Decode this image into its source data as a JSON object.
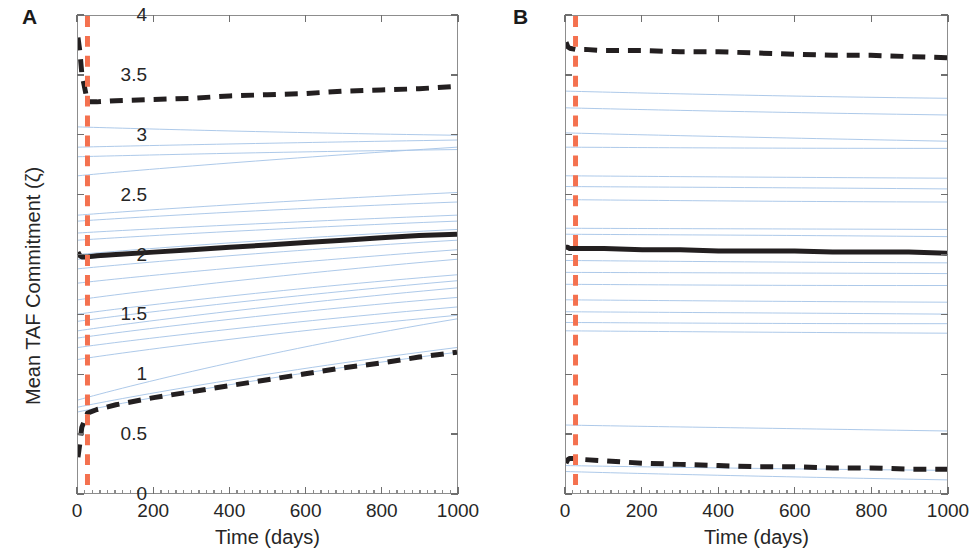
{
  "figure": {
    "panels": [
      {
        "letter": "A",
        "axes": {
          "xlabel": "Time (days)",
          "ylabel": "Mean TAF Commitment (ζ)",
          "xticks": [
            0,
            200,
            400,
            600,
            800,
            1000
          ],
          "xtick_labels": [
            "0",
            "200",
            "400",
            "600",
            "800",
            "1000"
          ],
          "yticks": [
            0,
            0.5,
            1,
            1.5,
            2,
            2.5,
            3,
            3.5,
            4
          ],
          "ytick_labels": [
            "0",
            "0.5",
            "1",
            "1.5",
            "2",
            "2.5",
            "3",
            "3.5",
            "4"
          ],
          "xlim": [
            0,
            1000
          ],
          "ylim": [
            0,
            4
          ]
        }
      },
      {
        "letter": "B",
        "axes": {
          "xlabel": "Time (days)",
          "ylabel": "",
          "xticks": [
            0,
            200,
            400,
            600,
            800,
            1000
          ],
          "xtick_labels": [
            "0",
            "200",
            "400",
            "600",
            "800",
            "1000"
          ],
          "yticks": [
            0,
            0.5,
            1,
            1.5,
            2,
            2.5,
            3,
            3.5,
            4
          ],
          "ytick_labels": [
            "0",
            "0.5",
            "1",
            "1.5",
            "2",
            "2.5",
            "3",
            "3.5",
            "4"
          ],
          "xlim": [
            0,
            1000
          ],
          "ylim": [
            0,
            4
          ]
        }
      }
    ]
  },
  "colors": {
    "trajectory_blue": "#a8c6e8",
    "mean_black": "#231f20",
    "ci_black": "#231f20",
    "event_line_red": "#f4714f",
    "axis_gray": "#8d8d8d",
    "text": "#262626"
  },
  "chart_data": [
    {
      "type": "line",
      "panel": "A",
      "title": "",
      "xlabel": "Time (days)",
      "ylabel": "Mean TAF Commitment (ζ)",
      "xlim": [
        0,
        1000
      ],
      "ylim": [
        0,
        4
      ],
      "xticks": [
        0,
        200,
        400,
        600,
        800,
        1000
      ],
      "yticks": [
        0,
        0.5,
        1,
        1.5,
        2,
        2.5,
        3,
        3.5,
        4
      ],
      "grid": false,
      "legend": "none",
      "annotations": [
        {
          "type": "vline",
          "x": 25,
          "style": "dashed",
          "color": "#f4714f",
          "label": "treatment/event time"
        }
      ],
      "x": [
        0,
        5,
        10,
        25,
        50,
        100,
        200,
        300,
        400,
        500,
        600,
        700,
        800,
        900,
        1000
      ],
      "series": [
        {
          "name": "upper bound (dashed)",
          "style": "dashed",
          "color": "#231f20",
          "width": 5,
          "values": [
            3.82,
            3.7,
            3.52,
            3.28,
            3.28,
            3.29,
            3.3,
            3.31,
            3.33,
            3.34,
            3.35,
            3.37,
            3.38,
            3.39,
            3.41
          ]
        },
        {
          "name": "mean (solid)",
          "style": "solid",
          "color": "#231f20",
          "width": 5,
          "values": [
            2.02,
            1.99,
            1.98,
            1.98,
            1.99,
            2.0,
            2.02,
            2.04,
            2.06,
            2.08,
            2.1,
            2.12,
            2.14,
            2.16,
            2.17
          ]
        },
        {
          "name": "lower bound (dashed)",
          "style": "dashed",
          "color": "#231f20",
          "width": 5,
          "values": [
            0.3,
            0.42,
            0.55,
            0.67,
            0.7,
            0.74,
            0.8,
            0.85,
            0.9,
            0.95,
            1.0,
            1.05,
            1.09,
            1.14,
            1.18
          ]
        }
      ],
      "trajectories": [
        {
          "start": 3.07,
          "end": 3.0
        },
        {
          "start": 2.9,
          "end": 2.96
        },
        {
          "start": 2.82,
          "end": 2.88
        },
        {
          "start": 2.66,
          "end": 2.9
        },
        {
          "start": 2.33,
          "end": 2.52
        },
        {
          "start": 2.28,
          "end": 2.44
        },
        {
          "start": 2.18,
          "end": 2.33
        },
        {
          "start": 2.12,
          "end": 2.28
        },
        {
          "start": 2.0,
          "end": 2.21
        },
        {
          "start": 1.96,
          "end": 2.17
        },
        {
          "start": 1.88,
          "end": 2.12
        },
        {
          "start": 1.76,
          "end": 2.04
        },
        {
          "start": 1.62,
          "end": 1.96
        },
        {
          "start": 1.5,
          "end": 1.83
        },
        {
          "start": 1.44,
          "end": 1.78
        },
        {
          "start": 1.36,
          "end": 1.72
        },
        {
          "start": 1.3,
          "end": 1.64
        },
        {
          "start": 1.22,
          "end": 1.56
        },
        {
          "start": 1.12,
          "end": 1.49
        },
        {
          "start": 0.78,
          "end": 1.46
        },
        {
          "start": 0.72,
          "end": 1.22
        },
        {
          "start": 0.68,
          "end": 1.18
        }
      ],
      "trajectory_count": 22
    },
    {
      "type": "line",
      "panel": "B",
      "title": "",
      "xlabel": "Time (days)",
      "ylabel": "",
      "xlim": [
        0,
        1000
      ],
      "ylim": [
        0,
        4
      ],
      "xticks": [
        0,
        200,
        400,
        600,
        800,
        1000
      ],
      "yticks": [
        0,
        0.5,
        1,
        1.5,
        2,
        2.5,
        3,
        3.5,
        4
      ],
      "grid": false,
      "legend": "none",
      "annotations": [
        {
          "type": "vline",
          "x": 25,
          "style": "dashed",
          "color": "#f4714f",
          "label": "treatment/event time"
        }
      ],
      "x": [
        0,
        5,
        10,
        25,
        50,
        100,
        200,
        300,
        400,
        500,
        600,
        700,
        800,
        900,
        1000
      ],
      "series": [
        {
          "name": "upper bound (dashed)",
          "style": "dashed",
          "color": "#231f20",
          "width": 5,
          "values": [
            3.78,
            3.74,
            3.73,
            3.72,
            3.72,
            3.71,
            3.71,
            3.7,
            3.7,
            3.69,
            3.68,
            3.67,
            3.67,
            3.66,
            3.65
          ]
        },
        {
          "name": "mean (solid)",
          "style": "solid",
          "color": "#231f20",
          "width": 5,
          "values": [
            2.06,
            2.06,
            2.05,
            2.05,
            2.05,
            2.05,
            2.04,
            2.04,
            2.03,
            2.03,
            2.03,
            2.02,
            2.02,
            2.02,
            2.01
          ]
        },
        {
          "name": "lower bound (dashed)",
          "style": "dashed",
          "color": "#231f20",
          "width": 5,
          "values": [
            0.25,
            0.28,
            0.29,
            0.29,
            0.28,
            0.27,
            0.25,
            0.24,
            0.23,
            0.22,
            0.22,
            0.21,
            0.21,
            0.2,
            0.2
          ]
        }
      ],
      "trajectories": [
        {
          "start": 3.37,
          "end": 3.31
        },
        {
          "start": 3.23,
          "end": 3.17
        },
        {
          "start": 3.02,
          "end": 2.95
        },
        {
          "start": 2.9,
          "end": 2.89
        },
        {
          "start": 2.66,
          "end": 2.64
        },
        {
          "start": 2.57,
          "end": 2.55
        },
        {
          "start": 2.46,
          "end": 2.44
        },
        {
          "start": 2.22,
          "end": 2.21
        },
        {
          "start": 2.17,
          "end": 2.15
        },
        {
          "start": 1.95,
          "end": 1.93
        },
        {
          "start": 1.85,
          "end": 1.84
        },
        {
          "start": 1.75,
          "end": 1.74
        },
        {
          "start": 1.62,
          "end": 1.6
        },
        {
          "start": 1.52,
          "end": 1.5
        },
        {
          "start": 1.43,
          "end": 1.42
        },
        {
          "start": 1.36,
          "end": 1.34
        },
        {
          "start": 0.57,
          "end": 0.52
        },
        {
          "start": 0.23,
          "end": 0.19
        },
        {
          "start": 0.18,
          "end": 0.11
        }
      ],
      "trajectory_count": 19
    }
  ]
}
